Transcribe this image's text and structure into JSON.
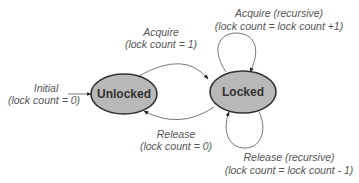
{
  "diagram": {
    "type": "state-machine",
    "colors": {
      "state_fill": "#b8b8b8",
      "state_stroke": "#333333",
      "edge": "#555555",
      "label_text": "#555555",
      "state_text": "#333333"
    },
    "states": [
      {
        "id": "unlocked",
        "label": "Unlocked"
      },
      {
        "id": "locked",
        "label": "Locked"
      }
    ],
    "transitions": [
      {
        "id": "initial",
        "from": null,
        "to": "unlocked",
        "line1": "Initial",
        "line2": "(lock count = 0)"
      },
      {
        "id": "acquire",
        "from": "unlocked",
        "to": "locked",
        "line1": "Acquire",
        "line2": "(lock count = 1)"
      },
      {
        "id": "acquire-recursive",
        "from": "locked",
        "to": "locked",
        "line1": "Acquire (recursive)",
        "line2": "(lock count = lock count +1)"
      },
      {
        "id": "release",
        "from": "locked",
        "to": "unlocked",
        "line1": "Release",
        "line2": "(lock count = 0)"
      },
      {
        "id": "release-recursive",
        "from": "locked",
        "to": "locked",
        "line1": "Release (recursive)",
        "line2": "(lock count = lock count - 1)"
      }
    ]
  }
}
